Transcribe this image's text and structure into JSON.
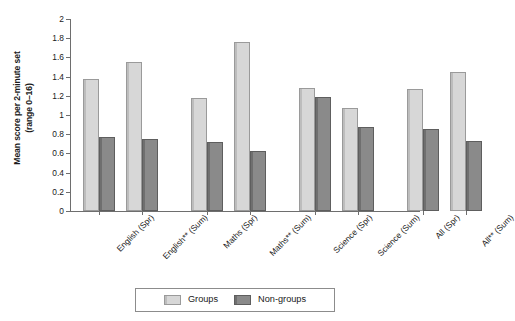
{
  "chart_data": {
    "type": "bar",
    "title": "",
    "xlabel": "",
    "ylabel": "Mean score per 2-minute set (range 0–16)",
    "ylabel_line1": "Mean score per 2-minute set",
    "ylabel_line2": "(range 0–16)",
    "ylim": [
      0,
      2
    ],
    "ytick_labels": [
      "2",
      "1.8",
      "1.6",
      "1.4",
      "1.2",
      "1",
      "0.8",
      "0.6",
      "0.4",
      "0.2",
      "0"
    ],
    "ytick_values": [
      2,
      1.8,
      1.6,
      1.4,
      1.2,
      1,
      0.8,
      0.6,
      0.4,
      0.2,
      0
    ],
    "grid": false,
    "legend_position": "bottom-center",
    "categories": [
      "English (Spr)",
      "English** (Sum)",
      "Maths (Spr)",
      "Maths** (Sum)",
      "Science (Spr)",
      "Science (Sum)",
      "All (Spr)",
      "All** (Sum)"
    ],
    "series": [
      {
        "name": "Groups",
        "color": "#d7d7d7",
        "values": [
          1.37,
          1.55,
          1.18,
          1.76,
          1.28,
          1.07,
          1.27,
          1.45
        ]
      },
      {
        "name": "Non-groups",
        "color": "#8a8a8a",
        "values": [
          0.77,
          0.75,
          0.72,
          0.63,
          1.19,
          0.88,
          0.85,
          0.73
        ]
      }
    ]
  },
  "legend": {
    "items": [
      {
        "label": "Groups",
        "key": "groups"
      },
      {
        "label": "Non-groups",
        "key": "nongroups"
      }
    ]
  }
}
